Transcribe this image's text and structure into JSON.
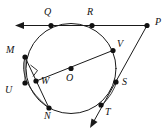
{
  "figure": {
    "stroke_color": "#1a1a1a",
    "point_color": "#111111",
    "background": "#ffffff",
    "circle": {
      "cx": 71,
      "cy": 68.5,
      "r": 45
    },
    "labels": {
      "Q": "Q",
      "R": "R",
      "P": "P",
      "M": "M",
      "V": "V",
      "O": "O",
      "S": "S",
      "U": "U",
      "W": "W",
      "N": "N",
      "T": "T"
    },
    "points": [
      {
        "name": "Q",
        "x": 51,
        "y": 25.5,
        "label_x": 45,
        "label_y": 8
      },
      {
        "name": "R",
        "x": 92,
        "y": 25.5,
        "label_x": 88,
        "label_y": 8
      },
      {
        "name": "P",
        "x": 147,
        "y": 25.5,
        "label_x": 154,
        "label_y": 19
      },
      {
        "name": "M",
        "x": 25,
        "y": 57,
        "label_x": 8,
        "label_y": 47
      },
      {
        "name": "V",
        "x": 113,
        "y": 50.5,
        "label_x": 117,
        "label_y": 41
      },
      {
        "name": "O",
        "x": 71,
        "y": 68.5,
        "label_x": 67,
        "label_y": 74
      },
      {
        "name": "S",
        "x": 116,
        "y": 82,
        "label_x": 122,
        "label_y": 79
      },
      {
        "name": "U",
        "x": 25,
        "y": 83,
        "label_x": 6,
        "label_y": 86
      },
      {
        "name": "W",
        "x": 37,
        "y": 81,
        "label_x": 41,
        "label_y": 78
      },
      {
        "name": "N",
        "x": 49,
        "y": 108,
        "label_x": 45,
        "label_y": 112
      },
      {
        "name": "T",
        "x": 101,
        "y": 105,
        "label_x": 105,
        "label_y": 109
      }
    ],
    "segments": [
      {
        "name": "ray-P-to-Q-arrow",
        "from": "P",
        "to": "Q",
        "has_arrow": true
      },
      {
        "name": "chord-P-to-T",
        "from": "P",
        "to": "T",
        "has_arrow": true
      },
      {
        "name": "diameter-W-to-V",
        "from": "W",
        "to": "V",
        "has_arrow": false
      },
      {
        "name": "chord-M-to-N",
        "from": "M",
        "to": "N",
        "has_arrow": false
      },
      {
        "name": "chord-M-to-U",
        "from": "M",
        "to": "U",
        "has_arrow": false
      }
    ],
    "arcs": [
      {
        "name": "arc-M-U-N-outer",
        "from": "M",
        "to": "N"
      },
      {
        "name": "arc-S-T-outer",
        "from": "S",
        "to": "T"
      }
    ],
    "right_angle": {
      "at": "W",
      "x": 30,
      "y": 66,
      "size": 8
    }
  }
}
